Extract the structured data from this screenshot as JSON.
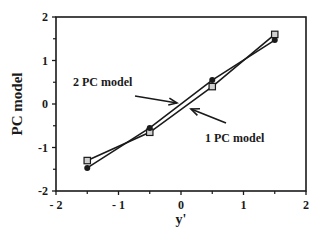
{
  "chart_data": {
    "type": "line",
    "title": "",
    "xlabel": "y'",
    "ylabel": "PC  model",
    "xlim": [
      -2,
      2
    ],
    "ylim": [
      -2,
      2
    ],
    "xticks": [
      -2,
      -1,
      0,
      1,
      2
    ],
    "yticks": [
      -2,
      -1,
      0,
      1,
      2
    ],
    "xtick_labels": [
      "- 2",
      "- 1",
      "0",
      "1",
      "2"
    ],
    "ytick_labels": [
      "-2",
      "-1",
      "0",
      "1",
      "2"
    ],
    "grid": false,
    "legend": "none (annotations with arrows)",
    "x": [
      -1.5,
      -0.5,
      0.5,
      1.5
    ],
    "series": [
      {
        "name": "1 PC model",
        "marker": "open-square",
        "values": [
          -1.3,
          -0.65,
          0.4,
          1.6
        ]
      },
      {
        "name": "2 PC model",
        "marker": "filled-circle",
        "values": [
          -1.47,
          -0.55,
          0.55,
          1.47
        ]
      }
    ],
    "annotations": [
      {
        "text": "2 PC  model",
        "points_to": "2 PC model line"
      },
      {
        "text": "1 PC  model",
        "points_to": "1 PC model line"
      }
    ]
  },
  "colors": {
    "line": "#1a1a1a",
    "square_fill": "#d0d0d0",
    "background": "#ffffff"
  }
}
